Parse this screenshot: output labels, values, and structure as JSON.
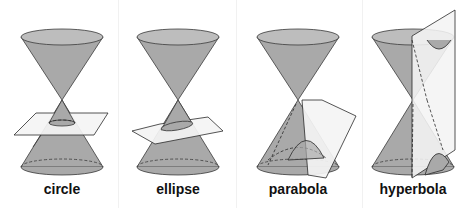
{
  "figure": {
    "title_fragment_visible": "",
    "panels": [
      {
        "id": "circle",
        "label": "circle",
        "cx": 62
      },
      {
        "id": "ellipse",
        "label": "ellipse",
        "cx": 178
      },
      {
        "id": "parabola",
        "label": "parabola",
        "cx": 298
      },
      {
        "id": "hyperbola",
        "label": "hyperbola",
        "cx": 413
      }
    ],
    "colors": {
      "cone_fill": "#a9a9a9",
      "cone_stroke": "#3a3a3a",
      "plane_fill": "#f4f4f4",
      "plane_stroke": "#2a2a2a",
      "background": "#ffffff"
    }
  }
}
